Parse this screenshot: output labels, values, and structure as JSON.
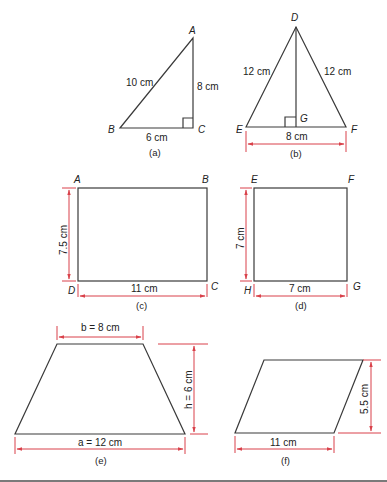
{
  "figures": {
    "a": {
      "caption": "(a)",
      "type": "right triangle",
      "vertices": {
        "A": "A",
        "B": "B",
        "C": "C"
      },
      "labels": {
        "hypotenuse": "10 cm",
        "vertical": "8 cm",
        "base": "6 cm"
      }
    },
    "b": {
      "caption": "(b)",
      "type": "isosceles triangle",
      "vertices": {
        "D": "D",
        "E": "E",
        "F": "F",
        "G": "G"
      },
      "labels": {
        "left": "12 cm",
        "right": "12 cm",
        "base": "8 cm"
      }
    },
    "c": {
      "caption": "(c)",
      "type": "rectangle",
      "vertices": {
        "A": "A",
        "B": "B",
        "C": "C",
        "D": "D"
      },
      "labels": {
        "height": "7.5 cm",
        "width": "11 cm"
      }
    },
    "d": {
      "caption": "(d)",
      "type": "square",
      "vertices": {
        "E": "E",
        "F": "F",
        "G": "G",
        "H": "H"
      },
      "labels": {
        "height": "7 cm",
        "width": "7 cm"
      }
    },
    "e": {
      "caption": "(e)",
      "type": "trapezium",
      "labels": {
        "top": "b = 8 cm",
        "height": "h = 6 cm",
        "bottom": "a = 12 cm"
      }
    },
    "f": {
      "caption": "(f)",
      "type": "parallelogram",
      "labels": {
        "height": "5.5 cm",
        "base": "11 cm"
      }
    }
  },
  "colors": {
    "shape_stroke": "#3a3a3a",
    "dimension": "#d9414a"
  }
}
